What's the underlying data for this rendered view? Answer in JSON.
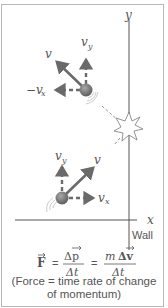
{
  "figure": {
    "axes": {
      "x_label": "x",
      "y_label": "y"
    },
    "wall_label": "Wall",
    "upper_ball": {
      "velocity_label": "v",
      "vy_label": "v",
      "vy_sub": "y",
      "vx_label": "−v",
      "vx_sub": "x"
    },
    "lower_ball": {
      "velocity_label": "v",
      "vy_label": "v",
      "vy_sub": "y",
      "vx_label": "v",
      "vx_sub": "x"
    },
    "formula": {
      "lhs": "F",
      "eq1": "=",
      "num1": "Δp",
      "den1": "Δt",
      "eq2": "=",
      "num2_m": "m",
      "num2": "Δv",
      "den2": "Δt"
    },
    "caption_line1": "(Force = time rate of change",
    "caption_line2": "of momentum)",
    "colors": {
      "arrow": "#6a6a6a",
      "ball": "#7a7a7a",
      "line": "#555555",
      "border": "#b8b8b8"
    }
  }
}
